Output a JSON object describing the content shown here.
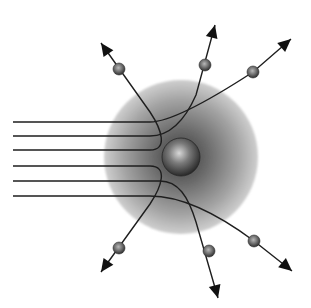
{
  "diagram": {
    "title": "",
    "colors": {
      "background": "#ffffff",
      "cloud_center": "#4a4a4a",
      "cloud_edge": "#c8c8c8",
      "nucleus_highlight": "#d8d8d8",
      "nucleus_shadow": "#2a2a2a",
      "particle_highlight": "#b0b0b0",
      "particle_shadow": "#2e2e2e",
      "line": "#1e1e1e"
    },
    "atom": {
      "cloud": {
        "cx": 181,
        "cy": 157,
        "r": 77
      },
      "nucleus": {
        "cx": 181,
        "cy": 157,
        "r": 19
      }
    },
    "paths": [
      {
        "id": "path-1",
        "d": "M13,122 L150,122 C170,122 210,100 253,72 L291,39",
        "particle": {
          "cx": 253,
          "cy": 72
        },
        "arrow": {
          "x": 291,
          "y": 39,
          "angle": -41
        }
      },
      {
        "id": "path-2",
        "d": "M13,136 L150,136 C170,136 185,120 196,95 L215,25",
        "particle": {
          "cx": 205,
          "cy": 65
        },
        "arrow": {
          "x": 215,
          "y": 25,
          "angle": -75
        }
      },
      {
        "id": "path-3",
        "d": "M13,150 L150,150 C168,150 162,130 150,112 L101,43",
        "particle": {
          "cx": 119,
          "cy": 69
        },
        "arrow": {
          "x": 101,
          "y": 43,
          "angle": -125
        }
      },
      {
        "id": "path-4",
        "d": "M13,166 L150,166 C168,166 162,186 150,204 L101,272",
        "particle": {
          "cx": 119,
          "cy": 248
        },
        "arrow": {
          "x": 101,
          "y": 272,
          "angle": 125
        }
      },
      {
        "id": "path-5",
        "d": "M13,181 L160,181 C178,181 188,196 196,222 L218,298",
        "particle": {
          "cx": 209,
          "cy": 251
        },
        "arrow": {
          "x": 218,
          "y": 298,
          "angle": 75
        }
      },
      {
        "id": "path-6",
        "d": "M13,196 L150,196 C180,196 215,212 254,241 L292,271",
        "particle": {
          "cx": 254,
          "cy": 241
        },
        "arrow": {
          "x": 292,
          "y": 271,
          "angle": 40
        }
      }
    ],
    "particle_radius": 6
  }
}
